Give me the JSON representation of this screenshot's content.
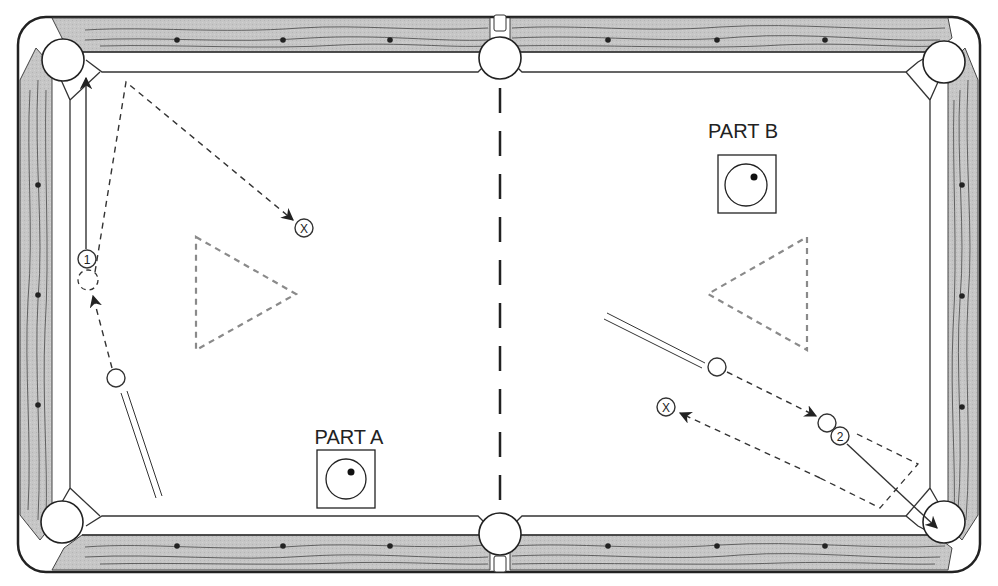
{
  "diagram": {
    "type": "pool-table-drill",
    "colors": {
      "rail_wood": "#c4c4c4",
      "grain": "#555555",
      "line": "#333333",
      "dashed_rack": "#8a8a8a",
      "cloth": "#ffffff"
    },
    "parts": [
      {
        "id": "A",
        "label": "PART A",
        "cue_ball_tip": "upper-right english (follow/right)",
        "object_ball": "1",
        "target_marker": "X"
      },
      {
        "id": "B",
        "label": "PART B",
        "cue_ball_tip": "upper-right english (follow/right)",
        "object_ball": "2",
        "target_marker": "X"
      }
    ],
    "balls": {
      "part_a_object": "1",
      "part_b_object": "2"
    },
    "markers": {
      "target": "X"
    },
    "pockets": [
      "top-left",
      "top-middle",
      "top-right",
      "bottom-left",
      "bottom-middle",
      "bottom-right"
    ],
    "racks": [
      "left-rack-triangle",
      "right-rack-triangle"
    ]
  }
}
